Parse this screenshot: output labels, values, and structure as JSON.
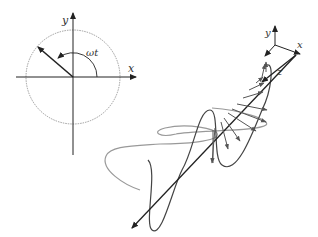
{
  "phasor": {
    "x_label": "x",
    "y_label": "y",
    "angle_label": "ωt"
  },
  "axes3d": {
    "x_label": "x",
    "y_label": "y",
    "z_label": "z"
  },
  "colors": {
    "axis": "#222222",
    "wave_vertical": "#444444",
    "wave_horizontal": "#9a9a9a",
    "circle": "#777777",
    "field_arrow": "#555555"
  }
}
